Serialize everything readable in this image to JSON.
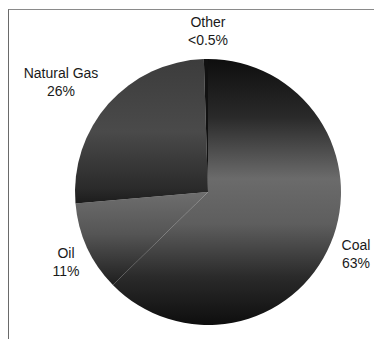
{
  "chart_data": {
    "type": "pie",
    "title": "",
    "categories": [
      "Coal",
      "Oil",
      "Natural Gas",
      "Other"
    ],
    "values": [
      63,
      11,
      26,
      0.5
    ],
    "value_labels": [
      "63%",
      "11%",
      "26%",
      "<0.5%"
    ],
    "start_angle_deg": 0,
    "direction": "clockwise",
    "legend": "none (data labels outside slices)"
  },
  "labels": {
    "other": {
      "name": "Other",
      "value": "<0.5%"
    },
    "natural_gas": {
      "name": "Natural Gas",
      "value": "26%"
    },
    "oil": {
      "name": "Oil",
      "value": "11%"
    },
    "coal": {
      "name": "Coal",
      "value": "63%"
    }
  },
  "colors": {
    "coal_top": "#111111",
    "coal_mid": "#6b6b6b",
    "coal_bottom": "#111111",
    "gas_top": "#3a3a3a",
    "gas_mid": "#262626",
    "gas_bottom": "#6a6a6a",
    "oil_top": "#6a6a6a",
    "oil_bottom": "#1e1e1e"
  }
}
